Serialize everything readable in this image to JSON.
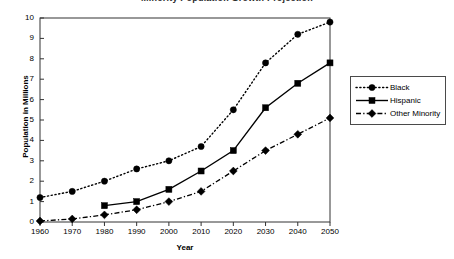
{
  "chart_data": {
    "type": "line",
    "title": "Minority Population Growth Projection",
    "xlabel": "Year",
    "ylabel": "Population in Millions",
    "x": [
      1960,
      1970,
      1980,
      1990,
      2000,
      2010,
      2020,
      2030,
      2040,
      2050
    ],
    "xtick_labels": [
      "1960",
      "1970",
      "1980",
      "1990",
      "2000",
      "2010",
      "2020",
      "2030",
      "2040",
      "2050"
    ],
    "ytick_labels": [
      "0",
      "1",
      "2",
      "3",
      "4",
      "5",
      "6",
      "7",
      "8",
      "9",
      "10"
    ],
    "xlim": [
      1960,
      2050
    ],
    "ylim": [
      0,
      10
    ],
    "ytick_step": 1,
    "grid": false,
    "legend_position": "right",
    "series": [
      {
        "name": "Black",
        "marker": "circle",
        "linestyle": "dotted",
        "color": "#000000",
        "x": [
          1960,
          1970,
          1980,
          1990,
          2000,
          2010,
          2020,
          2030,
          2040,
          2050
        ],
        "values": [
          1.2,
          1.5,
          2.0,
          2.6,
          3.0,
          3.7,
          5.5,
          7.8,
          9.2,
          9.8
        ]
      },
      {
        "name": "Hispanic",
        "marker": "square",
        "linestyle": "solid",
        "color": "#000000",
        "x": [
          1980,
          1990,
          2000,
          2010,
          2020,
          2030,
          2040,
          2050
        ],
        "values": [
          0.8,
          1.0,
          1.6,
          2.5,
          3.5,
          5.6,
          6.8,
          7.8
        ]
      },
      {
        "name": "Other Minority",
        "marker": "diamond",
        "linestyle": "dashdot",
        "color": "#000000",
        "x": [
          1960,
          1970,
          1980,
          1990,
          2000,
          2010,
          2020,
          2030,
          2040,
          2050
        ],
        "values": [
          0.05,
          0.15,
          0.35,
          0.6,
          1.0,
          1.5,
          2.5,
          3.5,
          4.3,
          5.1
        ]
      }
    ]
  }
}
